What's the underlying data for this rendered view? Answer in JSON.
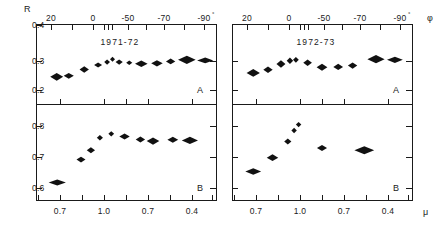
{
  "figure": {
    "width": 436,
    "height": 229,
    "background": "#ffffff",
    "ink_color": "#1a1a1a",
    "marker_color": "#111111"
  },
  "axis_labels": {
    "y_axis": "R",
    "x_axis_top": "φ",
    "x_axis_bottom": "μ",
    "degree_marker": "°"
  },
  "panels": {
    "top_left": {
      "title": "1971-72",
      "letter": "A"
    },
    "top_right": {
      "title": "1972-73",
      "letter": "A"
    },
    "bottom_left": {
      "title": "",
      "letter": "B"
    },
    "bottom_right": {
      "title": "",
      "letter": "B"
    }
  },
  "ticks": {
    "top_axis_labels": [
      "20",
      "0",
      "-50",
      "-70",
      "-90"
    ],
    "bottom_axis_labels": [
      "0.7",
      "1.0",
      "0.7",
      "0.4"
    ],
    "y_top_labels": [
      "0.4",
      "0.3",
      "0.2"
    ],
    "y_bottom_labels": [
      "0.8",
      "0.7",
      "0.6"
    ]
  },
  "chart_data": {
    "type": "scatter",
    "xlabel_top": "φ (degrees)",
    "xlabel_bottom": "μ",
    "ylabel": "R",
    "grid": false,
    "legend": "none",
    "marker_shape": "horizontal diamond (error bar lozenge)",
    "panel_layout": "2 rows (A upper, B lower) x 2 columns (1971-72 left, 1972-73 right)",
    "axes": {
      "top_x_tick_values": [
        20,
        0,
        -50,
        -70,
        -90
      ],
      "top_x_tick_labels": [
        "20",
        "0",
        "-50",
        "-70",
        "-90°"
      ],
      "bottom_x_tick_labels": [
        "0.7",
        "1.0",
        "0.7",
        "0.4"
      ],
      "row_A_ylim": [
        0.15,
        0.4
      ],
      "row_A_yticks": [
        0.4,
        0.3,
        0.2
      ],
      "row_B_ylim": [
        0.55,
        0.84
      ],
      "row_B_yticks": [
        0.8,
        0.7,
        0.6
      ]
    },
    "panels": [
      {
        "name": "1971-72 A",
        "row": "A",
        "season": "1971-72",
        "ylabel": "R",
        "ylim": [
          0.15,
          0.4
        ],
        "points": [
          {
            "x_frac": 0.115,
            "y": 0.235,
            "half_width_frac": 0.036,
            "half_height": 0.012
          },
          {
            "x_frac": 0.182,
            "y": 0.238,
            "half_width_frac": 0.028,
            "half_height": 0.009
          },
          {
            "x_frac": 0.268,
            "y": 0.258,
            "half_width_frac": 0.026,
            "half_height": 0.01
          },
          {
            "x_frac": 0.345,
            "y": 0.272,
            "half_width_frac": 0.022,
            "half_height": 0.008
          },
          {
            "x_frac": 0.395,
            "y": 0.281,
            "half_width_frac": 0.016,
            "half_height": 0.008
          },
          {
            "x_frac": 0.425,
            "y": 0.29,
            "half_width_frac": 0.014,
            "half_height": 0.008
          },
          {
            "x_frac": 0.462,
            "y": 0.281,
            "half_width_frac": 0.02,
            "half_height": 0.008
          },
          {
            "x_frac": 0.518,
            "y": 0.279,
            "half_width_frac": 0.017,
            "half_height": 0.007
          },
          {
            "x_frac": 0.585,
            "y": 0.276,
            "half_width_frac": 0.035,
            "half_height": 0.01
          },
          {
            "x_frac": 0.672,
            "y": 0.277,
            "half_width_frac": 0.032,
            "half_height": 0.01
          },
          {
            "x_frac": 0.748,
            "y": 0.283,
            "half_width_frac": 0.026,
            "half_height": 0.009
          },
          {
            "x_frac": 0.838,
            "y": 0.288,
            "half_width_frac": 0.049,
            "half_height": 0.013
          },
          {
            "x_frac": 0.94,
            "y": 0.286,
            "half_width_frac": 0.045,
            "half_height": 0.009
          }
        ]
      },
      {
        "name": "1972-73 A",
        "row": "A",
        "season": "1972-73",
        "ylabel": "R",
        "ylim": [
          0.15,
          0.4
        ],
        "points": [
          {
            "x_frac": 0.118,
            "y": 0.247,
            "half_width_frac": 0.037,
            "half_height": 0.012
          },
          {
            "x_frac": 0.2,
            "y": 0.257,
            "half_width_frac": 0.026,
            "half_height": 0.01
          },
          {
            "x_frac": 0.272,
            "y": 0.275,
            "half_width_frac": 0.025,
            "half_height": 0.012
          },
          {
            "x_frac": 0.322,
            "y": 0.285,
            "half_width_frac": 0.018,
            "half_height": 0.01
          },
          {
            "x_frac": 0.355,
            "y": 0.288,
            "half_width_frac": 0.016,
            "half_height": 0.009
          },
          {
            "x_frac": 0.42,
            "y": 0.279,
            "half_width_frac": 0.024,
            "half_height": 0.01
          },
          {
            "x_frac": 0.5,
            "y": 0.265,
            "half_width_frac": 0.03,
            "half_height": 0.011
          },
          {
            "x_frac": 0.59,
            "y": 0.266,
            "half_width_frac": 0.027,
            "half_height": 0.01
          },
          {
            "x_frac": 0.67,
            "y": 0.27,
            "half_width_frac": 0.026,
            "half_height": 0.01
          },
          {
            "x_frac": 0.8,
            "y": 0.29,
            "half_width_frac": 0.048,
            "half_height": 0.013
          },
          {
            "x_frac": 0.905,
            "y": 0.288,
            "half_width_frac": 0.044,
            "half_height": 0.01
          }
        ]
      },
      {
        "name": "1971-72 B",
        "row": "B",
        "season": "1971-72",
        "ylabel": "R",
        "ylim": [
          0.55,
          0.84
        ],
        "points": [
          {
            "x_frac": 0.118,
            "y": 0.603,
            "half_width_frac": 0.048,
            "half_height": 0.009
          },
          {
            "x_frac": 0.25,
            "y": 0.672,
            "half_width_frac": 0.025,
            "half_height": 0.009
          },
          {
            "x_frac": 0.305,
            "y": 0.7,
            "half_width_frac": 0.023,
            "half_height": 0.009
          },
          {
            "x_frac": 0.355,
            "y": 0.738,
            "half_width_frac": 0.017,
            "half_height": 0.008
          },
          {
            "x_frac": 0.418,
            "y": 0.75,
            "half_width_frac": 0.016,
            "half_height": 0.008
          },
          {
            "x_frac": 0.492,
            "y": 0.742,
            "half_width_frac": 0.029,
            "half_height": 0.009
          },
          {
            "x_frac": 0.58,
            "y": 0.733,
            "half_width_frac": 0.026,
            "half_height": 0.009
          },
          {
            "x_frac": 0.65,
            "y": 0.728,
            "half_width_frac": 0.035,
            "half_height": 0.011
          },
          {
            "x_frac": 0.76,
            "y": 0.732,
            "half_width_frac": 0.03,
            "half_height": 0.009
          },
          {
            "x_frac": 0.855,
            "y": 0.73,
            "half_width_frac": 0.045,
            "half_height": 0.011
          }
        ]
      },
      {
        "name": "1972-73 B",
        "row": "B",
        "season": "1972-73",
        "ylabel": "R",
        "ylim": [
          0.55,
          0.84
        ],
        "points": [
          {
            "x_frac": 0.118,
            "y": 0.636,
            "half_width_frac": 0.044,
            "half_height": 0.01
          },
          {
            "x_frac": 0.225,
            "y": 0.678,
            "half_width_frac": 0.032,
            "half_height": 0.01
          },
          {
            "x_frac": 0.31,
            "y": 0.727,
            "half_width_frac": 0.02,
            "half_height": 0.009
          },
          {
            "x_frac": 0.345,
            "y": 0.76,
            "half_width_frac": 0.015,
            "half_height": 0.008
          },
          {
            "x_frac": 0.37,
            "y": 0.778,
            "half_width_frac": 0.015,
            "half_height": 0.008
          },
          {
            "x_frac": 0.5,
            "y": 0.707,
            "half_width_frac": 0.028,
            "half_height": 0.009
          },
          {
            "x_frac": 0.735,
            "y": 0.7,
            "half_width_frac": 0.055,
            "half_height": 0.012
          }
        ]
      }
    ]
  }
}
